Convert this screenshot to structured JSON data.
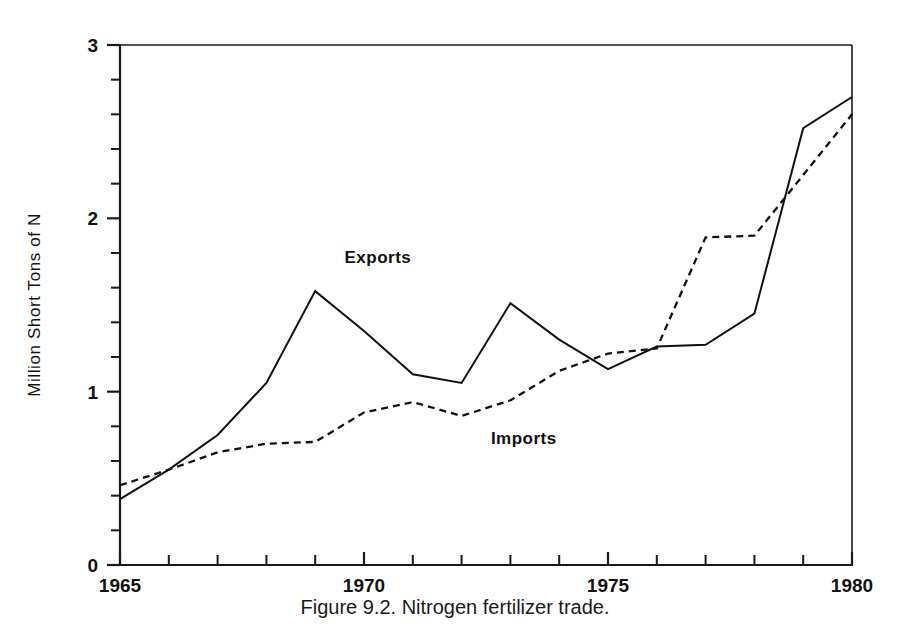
{
  "figure": {
    "caption": "Figure 9.2.  Nitrogen fertilizer trade.",
    "caption_number": "Figure 9.2.",
    "caption_text": "Nitrogen fertilizer trade."
  },
  "chart_data": {
    "type": "line",
    "title": "",
    "subtitle": "",
    "xlabel": "",
    "ylabel": "Million Short Tons of N",
    "xlim": [
      1965,
      1980
    ],
    "ylim": [
      0,
      3
    ],
    "grid": false,
    "legend_position": "inline-annotations",
    "x": [
      1965,
      1966,
      1967,
      1968,
      1969,
      1970,
      1971,
      1972,
      1973,
      1974,
      1975,
      1976,
      1977,
      1978,
      1979,
      1980
    ],
    "x_tick_labels": [
      "1965",
      "1970",
      "1975",
      "1980"
    ],
    "x_tick_values": [
      1965,
      1970,
      1975,
      1980
    ],
    "x_minor_tick_interval": 1,
    "y_tick_labels": [
      "0",
      "1",
      "2",
      "3"
    ],
    "y_tick_values": [
      0,
      1,
      2,
      3
    ],
    "y_minor_tick_interval": 0.2,
    "series": [
      {
        "name": "Exports",
        "style": "solid",
        "color": "#111111",
        "label_x": 1969.6,
        "label_y": 1.74,
        "values": [
          0.38,
          0.55,
          0.75,
          1.05,
          1.58,
          1.35,
          1.1,
          1.05,
          1.51,
          1.3,
          1.13,
          1.26,
          1.27,
          1.45,
          2.52,
          2.7
        ]
      },
      {
        "name": "Imports",
        "style": "dashed",
        "color": "#111111",
        "label_x": 1972.6,
        "label_y": 0.7,
        "values": [
          0.46,
          0.55,
          0.65,
          0.7,
          0.71,
          0.88,
          0.94,
          0.86,
          0.95,
          1.12,
          1.22,
          1.25,
          1.89,
          1.9,
          2.25,
          2.6
        ]
      }
    ]
  }
}
